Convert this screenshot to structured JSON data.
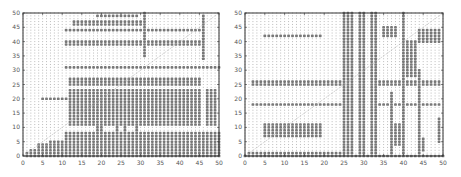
{
  "chart_data": [
    {
      "type": "scatter",
      "title": "",
      "xlabel": "",
      "ylabel": "",
      "xlim": [
        0,
        50
      ],
      "ylim": [
        0,
        50
      ],
      "xticks": [
        0,
        5,
        10,
        15,
        20,
        25,
        30,
        35,
        40,
        45,
        50
      ],
      "yticks": [
        0,
        5,
        10,
        15,
        20,
        25,
        30,
        35,
        40,
        45,
        50
      ],
      "grid": false,
      "legend": null,
      "background_points": "faint dots at every integer (x,y) in [0,50]x[0,50]",
      "diagonal_line": {
        "from": [
          0,
          0
        ],
        "to": [
          50,
          50
        ],
        "style": "dotted"
      },
      "marked_regions": [
        {
          "x": [
            1,
            1
          ],
          "y": [
            0,
            1
          ]
        },
        {
          "x": [
            2,
            3
          ],
          "y": [
            0,
            2
          ]
        },
        {
          "x": [
            4,
            6
          ],
          "y": [
            0,
            4
          ]
        },
        {
          "x": [
            7,
            10
          ],
          "y": [
            0,
            5
          ]
        },
        {
          "x": [
            11,
            50
          ],
          "y": [
            0,
            8
          ]
        },
        {
          "x": [
            19,
            20
          ],
          "y": [
            0,
            10
          ]
        },
        {
          "x": [
            24,
            24
          ],
          "y": [
            0,
            10
          ]
        },
        {
          "x": [
            26,
            26
          ],
          "y": [
            0,
            10
          ]
        },
        {
          "x": [
            29,
            29
          ],
          "y": [
            0,
            10
          ]
        },
        {
          "x": [
            12,
            45
          ],
          "y": [
            11,
            23
          ]
        },
        {
          "x": [
            47,
            49
          ],
          "y": [
            11,
            23
          ]
        },
        {
          "x": [
            12,
            45
          ],
          "y": [
            25,
            27
          ]
        },
        {
          "x": [
            5,
            11
          ],
          "y": [
            20,
            20
          ]
        },
        {
          "x": [
            11,
            50
          ],
          "y": [
            31,
            31
          ]
        },
        {
          "x": [
            11,
            45
          ],
          "y": [
            39,
            40
          ]
        },
        {
          "x": [
            11,
            45
          ],
          "y": [
            44,
            44
          ]
        },
        {
          "x": [
            13,
            30
          ],
          "y": [
            46,
            47
          ]
        },
        {
          "x": [
            19,
            29
          ],
          "y": [
            49,
            49
          ]
        },
        {
          "x": [
            31,
            31
          ],
          "y": [
            35,
            50
          ]
        },
        {
          "x": [
            46,
            46
          ],
          "y": [
            34,
            49
          ]
        }
      ]
    },
    {
      "type": "scatter",
      "title": "",
      "xlabel": "",
      "ylabel": "",
      "xlim": [
        0,
        50
      ],
      "ylim": [
        0,
        50
      ],
      "xticks": [
        0,
        5,
        10,
        15,
        20,
        25,
        30,
        35,
        40,
        45,
        50
      ],
      "yticks": [
        0,
        5,
        10,
        15,
        20,
        25,
        30,
        35,
        40,
        45,
        50
      ],
      "grid": false,
      "legend": null,
      "background_points": "faint dots at every integer (x,y) in [0,50]x[0,50]",
      "diagonal_line": {
        "from": [
          0,
          0
        ],
        "to": [
          50,
          50
        ],
        "style": "dotted"
      },
      "marked_regions": [
        {
          "x": [
            0,
            50
          ],
          "y": [
            0,
            0
          ]
        },
        {
          "x": [
            1,
            24
          ],
          "y": [
            1,
            1
          ]
        },
        {
          "x": [
            25,
            27
          ],
          "y": [
            0,
            50
          ]
        },
        {
          "x": [
            29,
            30
          ],
          "y": [
            0,
            50
          ]
        },
        {
          "x": [
            32,
            33
          ],
          "y": [
            0,
            50
          ]
        },
        {
          "x": [
            40,
            40
          ],
          "y": [
            0,
            50
          ]
        },
        {
          "x": [
            5,
            19
          ],
          "y": [
            7,
            11
          ]
        },
        {
          "x": [
            2,
            24
          ],
          "y": [
            18,
            18
          ]
        },
        {
          "x": [
            2,
            24
          ],
          "y": [
            25,
            26
          ]
        },
        {
          "x": [
            5,
            19
          ],
          "y": [
            42,
            42
          ]
        },
        {
          "x": [
            34,
            39
          ],
          "y": [
            25,
            26
          ]
        },
        {
          "x": [
            41,
            49
          ],
          "y": [
            25,
            26
          ]
        },
        {
          "x": [
            37,
            37
          ],
          "y": [
            0,
            22
          ]
        },
        {
          "x": [
            38,
            39
          ],
          "y": [
            4,
            11
          ]
        },
        {
          "x": [
            41,
            43
          ],
          "y": [
            28,
            40
          ]
        },
        {
          "x": [
            44,
            44
          ],
          "y": [
            0,
            30
          ]
        },
        {
          "x": [
            45,
            45
          ],
          "y": [
            2,
            6
          ]
        },
        {
          "x": [
            44,
            49
          ],
          "y": [
            40,
            44
          ]
        },
        {
          "x": [
            34,
            49
          ],
          "y": [
            18,
            18
          ]
        },
        {
          "x": [
            49,
            49
          ],
          "y": [
            5,
            13
          ]
        },
        {
          "x": [
            35,
            38
          ],
          "y": [
            42,
            45
          ]
        }
      ]
    }
  ],
  "axes": {
    "left": {
      "xtick_labels": [
        "0",
        "5",
        "10",
        "15",
        "20",
        "25",
        "30",
        "35",
        "40",
        "45",
        "50"
      ],
      "ytick_labels": [
        "0",
        "5",
        "10",
        "15",
        "20",
        "25",
        "30",
        "35",
        "40",
        "45",
        "50"
      ]
    },
    "right": {
      "xtick_labels": [
        "0",
        "5",
        "10",
        "15",
        "20",
        "25",
        "30",
        "35",
        "40",
        "45",
        "50"
      ],
      "ytick_labels": [
        "0",
        "5",
        "10",
        "15",
        "20",
        "25",
        "30",
        "35",
        "40",
        "45",
        "50"
      ]
    }
  },
  "colors": {
    "frame": "#333333",
    "faint_dot": "#bbbbbb",
    "marked_dot": "#777777",
    "diagonal": "#aaaaaa",
    "tick_label": "#555555"
  }
}
